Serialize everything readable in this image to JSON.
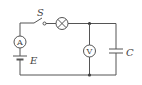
{
  "diagram": {
    "type": "circuit",
    "components": {
      "switch": {
        "label": "S"
      },
      "lamp": {
        "label": ""
      },
      "ammeter": {
        "label": "A"
      },
      "voltmeter": {
        "label": "V"
      },
      "capacitor": {
        "label": "C"
      },
      "battery": {
        "label": "E"
      }
    },
    "colors": {
      "wire": "#555555",
      "background": "#ffffff"
    }
  }
}
